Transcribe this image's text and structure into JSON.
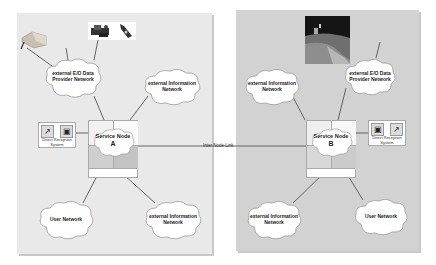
{
  "diagram": {
    "type": "network-architecture",
    "inter_node_link": "Inter Node Link",
    "panel_a": {
      "service_node": {
        "title": "Service Node",
        "letter": "A"
      },
      "clouds": [
        {
          "id": "eo-provider",
          "line1": "external E/O Data",
          "line2": "Provider Network"
        },
        {
          "id": "ext-info-top",
          "line1": "external Information",
          "line2": "Network"
        },
        {
          "id": "user",
          "line1": "User Network",
          "line2": ""
        },
        {
          "id": "ext-info-bottom",
          "line1": "external Information",
          "line2": "Network"
        }
      ],
      "direct_reception": {
        "line1": "Direct Reception",
        "line2": "System",
        "icons": [
          "satellite-dish-icon",
          "computer-icon"
        ]
      },
      "images": [
        "satellite-image",
        "computer-equipment-image",
        "small-satellite-image"
      ]
    },
    "panel_b": {
      "service_node": {
        "title": "Service Node",
        "letter": "B"
      },
      "clouds": [
        {
          "id": "ext-info-top",
          "line1": "external Information",
          "line2": "Network"
        },
        {
          "id": "eo-provider",
          "line1": "external E/O Data",
          "line2": "Provider Network"
        },
        {
          "id": "ext-info-bottom",
          "line1": "external Information",
          "line2": "Network"
        },
        {
          "id": "user",
          "line1": "User Network",
          "line2": ""
        }
      ],
      "direct_reception": {
        "line1": "Direct Reception",
        "line2": "System",
        "icons": [
          "computer-icon",
          "satellite-dish-icon"
        ]
      },
      "images": [
        "earth-from-space-photo"
      ]
    },
    "colors": {
      "panel_a_bg": "#e9e9e9",
      "panel_b_bg": "#d2d2d2",
      "cloud_fill": "#ffffff",
      "line": "#555555"
    }
  }
}
